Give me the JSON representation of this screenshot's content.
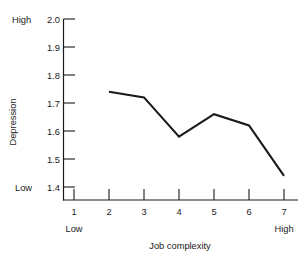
{
  "chart_data": {
    "type": "line",
    "title": "",
    "subtitle": "",
    "xlabel": "Job complexity",
    "ylabel": "Depression",
    "x": [
      2,
      3,
      4,
      5,
      6,
      7
    ],
    "values": [
      1.74,
      1.72,
      1.58,
      1.66,
      1.62,
      1.44
    ],
    "series": [
      {
        "name": "Depression",
        "values": [
          1.74,
          1.72,
          1.58,
          1.66,
          1.62,
          1.44
        ]
      }
    ],
    "xlim": [
      1,
      7
    ],
    "ylim": [
      1.4,
      2.0
    ],
    "x_ticks": [
      "1",
      "2",
      "3",
      "4",
      "5",
      "6",
      "7"
    ],
    "y_ticks": [
      "2.0",
      "1.9",
      "1.8",
      "1.7",
      "1.6",
      "1.5",
      "1.4"
    ],
    "y_axis_high_label": "High",
    "y_axis_low_label": "Low",
    "x_axis_low_label": "Low",
    "x_axis_high_label": "High",
    "grid": false,
    "legend": "none",
    "line_color": "#1a1a1a",
    "background_color": "#ffffff"
  },
  "axes": {
    "y": {
      "title": "Depression",
      "anchor_high": "High",
      "anchor_low": "Low",
      "ticks": [
        {
          "label": "2.0",
          "value": 2.0
        },
        {
          "label": "1.9",
          "value": 1.9
        },
        {
          "label": "1.8",
          "value": 1.8
        },
        {
          "label": "1.7",
          "value": 1.7
        },
        {
          "label": "1.6",
          "value": 1.6
        },
        {
          "label": "1.5",
          "value": 1.5
        },
        {
          "label": "1.4",
          "value": 1.4
        }
      ]
    },
    "x": {
      "title": "Job complexity",
      "anchor_low": "Low",
      "anchor_high": "High",
      "ticks": [
        {
          "label": "1",
          "value": 1
        },
        {
          "label": "2",
          "value": 2
        },
        {
          "label": "3",
          "value": 3
        },
        {
          "label": "4",
          "value": 4
        },
        {
          "label": "5",
          "value": 5
        },
        {
          "label": "6",
          "value": 6
        },
        {
          "label": "7",
          "value": 7
        }
      ]
    }
  }
}
